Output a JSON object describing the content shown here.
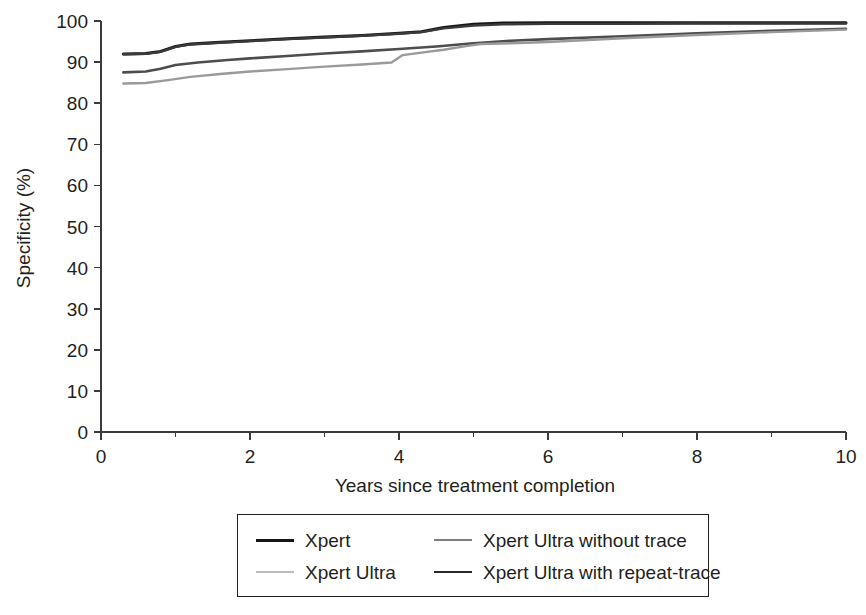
{
  "chart_data": {
    "type": "line",
    "title": "",
    "xlabel": "Years since treatment completion",
    "ylabel": "Specificity (%)",
    "xlim": [
      0,
      10
    ],
    "ylim": [
      0,
      100
    ],
    "xticks": [
      0,
      2,
      4,
      6,
      8,
      10
    ],
    "xticks_minor": [
      1,
      3,
      5,
      7,
      9
    ],
    "yticks": [
      0,
      10,
      20,
      30,
      40,
      50,
      60,
      70,
      80,
      90,
      100
    ],
    "xtick_labels": [
      "0",
      "2",
      "4",
      "6",
      "8",
      "10"
    ],
    "ytick_labels": [
      "0",
      "10",
      "20",
      "30",
      "40",
      "50",
      "60",
      "70",
      "80",
      "90",
      "100"
    ],
    "grid": false,
    "legend_position": "below-center",
    "series": [
      {
        "name": "Xpert",
        "color": "#151515",
        "width": 3.0,
        "x": [
          0.3,
          0.6,
          0.8,
          1.0,
          1.2,
          1.6,
          2.0,
          2.5,
          3.0,
          3.5,
          4.0,
          4.3,
          4.6,
          5.0,
          5.4,
          6.0,
          7.0,
          8.0,
          9.0,
          10.0
        ],
        "y": [
          92.0,
          92.1,
          92.6,
          93.8,
          94.4,
          94.8,
          95.2,
          95.7,
          96.1,
          96.5,
          97.0,
          97.4,
          98.4,
          99.2,
          99.5,
          99.6,
          99.6,
          99.6,
          99.6,
          99.6
        ]
      },
      {
        "name": "Xpert Ultra with repeat-trace",
        "color": "#3a3a3a",
        "width": 2.4,
        "x": [
          0.3,
          0.6,
          0.8,
          1.0,
          1.2,
          1.6,
          2.0,
          2.5,
          3.0,
          3.5,
          4.0,
          4.3,
          4.6,
          5.0,
          5.4,
          6.0,
          7.0,
          8.0,
          9.0,
          10.0
        ],
        "y": [
          91.9,
          92.0,
          92.5,
          93.7,
          94.3,
          94.7,
          95.1,
          95.6,
          96.0,
          96.4,
          96.9,
          97.3,
          98.2,
          98.9,
          99.2,
          99.3,
          99.3,
          99.4,
          99.4,
          99.4
        ]
      },
      {
        "name": "Xpert Ultra without trace",
        "color": "#4d4d4d",
        "width": 2.6,
        "x": [
          0.3,
          0.6,
          0.8,
          1.0,
          1.3,
          1.7,
          2.0,
          2.5,
          3.0,
          3.5,
          4.0,
          4.5,
          5.0,
          5.5,
          6.0,
          7.0,
          8.0,
          9.0,
          10.0
        ],
        "y": [
          87.5,
          87.7,
          88.4,
          89.3,
          89.9,
          90.5,
          90.9,
          91.5,
          92.1,
          92.6,
          93.2,
          93.8,
          94.6,
          95.2,
          95.6,
          96.3,
          97.0,
          97.6,
          98.1
        ]
      },
      {
        "name": "Xpert Ultra",
        "color": "#9a9a9a",
        "width": 2.4,
        "x": [
          0.3,
          0.6,
          0.9,
          1.2,
          1.6,
          2.0,
          2.5,
          3.0,
          3.5,
          3.9,
          4.05,
          4.3,
          4.6,
          4.9,
          5.1,
          5.5,
          6.0,
          7.0,
          8.0,
          9.0,
          10.0
        ],
        "y": [
          84.8,
          84.9,
          85.6,
          86.4,
          87.1,
          87.7,
          88.3,
          88.9,
          89.4,
          89.9,
          91.7,
          92.3,
          93.0,
          93.9,
          94.4,
          94.6,
          94.9,
          95.8,
          96.6,
          97.3,
          97.9
        ]
      }
    ]
  },
  "legend": {
    "entries": [
      {
        "label": "Xpert",
        "color": "#151515",
        "width": 3.2
      },
      {
        "label": "Xpert Ultra without trace",
        "color": "#7d7d7d",
        "width": 2.6
      },
      {
        "label": "Xpert Ultra",
        "color": "#bcbcbc",
        "width": 2.4
      },
      {
        "label": "Xpert Ultra with repeat-trace",
        "color": "#2a2a2a",
        "width": 2.6
      }
    ]
  }
}
